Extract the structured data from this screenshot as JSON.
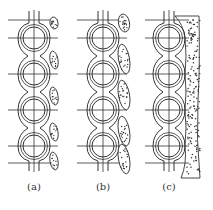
{
  "figure": {
    "panels": [
      {
        "id": "a",
        "label": "(a)",
        "center_x": 34,
        "deposit": "small-lens"
      },
      {
        "id": "b",
        "label": "(b)",
        "center_x": 103,
        "deposit": "elongated-lens"
      },
      {
        "id": "c",
        "label": "(c)",
        "center_x": 169,
        "deposit": "continuous-layer"
      }
    ],
    "tube_rows_y": [
      38,
      74,
      110,
      146
    ],
    "tube_outer_radius": 14,
    "tube_inner_radius": 11,
    "top_line_y": 20,
    "bottom_line_y": 163,
    "colors": {
      "stroke": "#333333",
      "background": "#ffffff",
      "deposit_fill": "#ffffff",
      "dots": "#333333"
    }
  }
}
